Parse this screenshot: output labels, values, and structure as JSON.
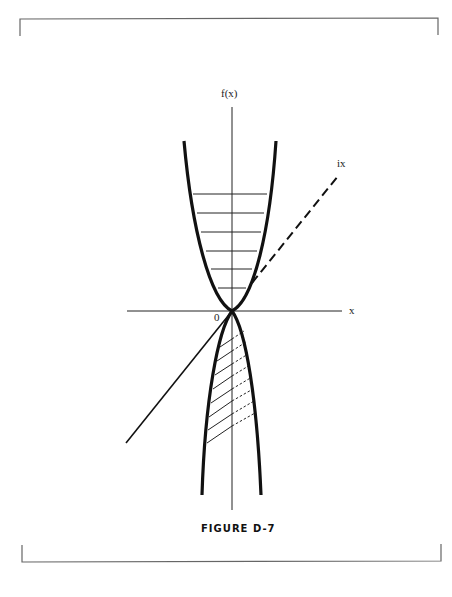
{
  "figure": {
    "caption": "FIGURE D-7",
    "labels": {
      "y_axis": "f(x)",
      "x_axis": "x",
      "origin": "0",
      "dashed_line": "ix"
    },
    "elements": [
      "frame-top-bracket",
      "frame-bottom-bracket",
      "x-axis",
      "y-axis",
      "upward-parabola-real",
      "horizontal-hatching-real",
      "dashed-line-ix",
      "downward-parabola-imaginary",
      "slanted-hatching-imaginary",
      "solid-diagonal-line"
    ],
    "colors": {
      "ink": "#111111",
      "frame": "#555555",
      "background": "#ffffff"
    }
  }
}
